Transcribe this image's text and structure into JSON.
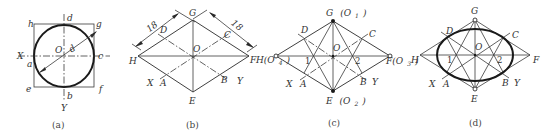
{
  "figure": {
    "panels": [
      {
        "id": "a",
        "caption": "(a)",
        "point_labels": {
          "h": "h",
          "d": "d",
          "g": "g",
          "X": "X",
          "a": "a",
          "c": "c",
          "e": "e",
          "f": "f",
          "b": "b",
          "Y": "Y",
          "O": "O"
        },
        "diameter_label": "d"
      },
      {
        "id": "b",
        "caption": "(b)",
        "point_labels": {
          "G": "G",
          "D": "D",
          "C": "C",
          "H": "H",
          "F": "F",
          "O": "O",
          "X": "X",
          "A": "A",
          "B": "B",
          "Y": "Y",
          "E": "E"
        },
        "dimension_left": "18",
        "dimension_right": "18"
      },
      {
        "id": "c",
        "caption": "(c)",
        "point_labels": {
          "G": "G",
          "G_sub": "(O",
          "G_subidx": "1",
          "G_close": ")",
          "D": "D",
          "C": "C",
          "O": "O",
          "H": "H(O",
          "H_subidx": "4",
          "H_close": ")",
          "F": "F(O",
          "F_subidx": "3",
          "F_close": ")",
          "one": "1",
          "two": "2",
          "X": "X",
          "A": "A",
          "B": "B",
          "Y": "Y",
          "E": "E",
          "E_sub": "(O",
          "E_subidx": "2",
          "E_close": ")"
        }
      },
      {
        "id": "d",
        "caption": "(d)",
        "point_labels": {
          "G": "G",
          "D": "D",
          "C": "C",
          "O": "O",
          "H": "H",
          "F": "F",
          "one": "1",
          "two": "2",
          "X": "X",
          "A": "A",
          "B": "B",
          "Y": "Y",
          "E": "E"
        }
      }
    ]
  }
}
